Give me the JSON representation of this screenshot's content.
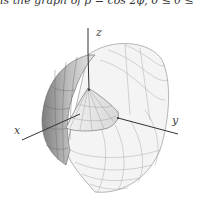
{
  "caption": "is the graph of ρ = cos 2φ, 0 ≤ θ ≤ 2π",
  "figure": {
    "axes": {
      "x": "x",
      "y": "y",
      "z": "z"
    },
    "colors": {
      "surface_dark": "#8a8a8a",
      "surface_mid": "#c4c4c4",
      "surface_light": "#eeeeee",
      "grid": "#707070",
      "axis": "#333333"
    }
  }
}
